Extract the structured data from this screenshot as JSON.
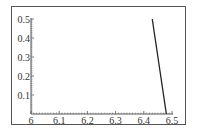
{
  "chart_data": {
    "type": "line",
    "title": "",
    "xlabel": "",
    "ylabel": "",
    "xlim": [
      6,
      6.5
    ],
    "ylim": [
      0,
      0.5
    ],
    "x_ticks": [
      "6",
      "6.1",
      "6.2",
      "6.3",
      "6.4",
      "6.5"
    ],
    "y_ticks": [
      "0.1",
      "0.2",
      "0.3",
      "0.4",
      "0.5"
    ],
    "grid": false,
    "legend": null,
    "series": [
      {
        "name": "curve",
        "x": [
          6.43,
          6.48
        ],
        "y": [
          0.5,
          0.0
        ],
        "color": "#222222"
      }
    ]
  },
  "colors": {
    "line": "#222222",
    "axis": "#555555",
    "frame": "#555555"
  }
}
